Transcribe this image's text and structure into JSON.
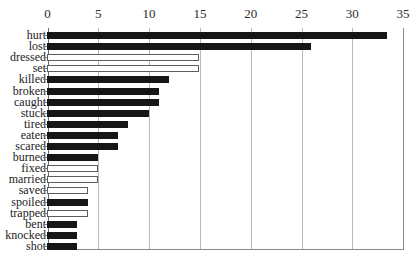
{
  "chart_data": {
    "type": "bar",
    "orientation": "horizontal",
    "title": "",
    "subtitle": "",
    "xlabel": "",
    "ylabel": "",
    "xlim": [
      0,
      35
    ],
    "ylim": null,
    "grid": true,
    "gridlines_axis": "x",
    "legend": null,
    "legend_position": "none",
    "x_ticks": [
      0,
      5,
      10,
      15,
      20,
      25,
      30,
      35
    ],
    "x_tick_labels": [
      "0",
      "5",
      "10",
      "15",
      "20",
      "25",
      "30",
      "35"
    ],
    "categories": [
      "hurt",
      "lost",
      "dressed",
      "set",
      "killed",
      "broken",
      "caught",
      "stuck",
      "tired",
      "eaten",
      "scared",
      "burned",
      "fixed",
      "married",
      "saved",
      "spoiled",
      "trapped",
      "bent",
      "knocked",
      "shot"
    ],
    "values": [
      33.5,
      26,
      15,
      15,
      12,
      11,
      11,
      10,
      8,
      7,
      7,
      5,
      5,
      5,
      4,
      4,
      4,
      3,
      3,
      3
    ],
    "bar_styles": [
      "filled",
      "filled",
      "open",
      "open",
      "filled",
      "filled",
      "filled",
      "filled",
      "filled",
      "filled",
      "filled",
      "filled",
      "open",
      "open",
      "open",
      "filled",
      "open",
      "filled",
      "filled",
      "filled"
    ],
    "colors": {
      "bar_filled": "#161616",
      "bar_open_fill": "#ffffff",
      "bar_open_stroke": "#5d5d5d",
      "gridline": "#b9b9b9",
      "axis": "#6d6d6d",
      "text": "#1c1c1c",
      "background": "#ffffff"
    }
  }
}
